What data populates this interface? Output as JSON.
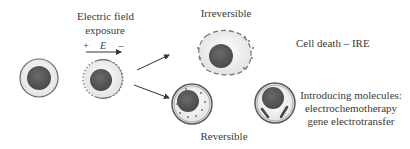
{
  "labels": {
    "exposure_line1": "Electric field",
    "exposure_line2": "exposure",
    "plus": "+",
    "field_symbol": "E",
    "minus": "–",
    "irreversible": "Irreversible",
    "cell_death": "Cell death – IRE",
    "reversible": "Reversible",
    "introducing_line1": "Introducing molecules:",
    "introducing_line2": "electrochemotherapy",
    "introducing_line3": "gene electrotransfer"
  },
  "colors": {
    "nucleus": "#575757",
    "cytoplasm": "#eeeeee",
    "membrane": "#6a6a6a",
    "text": "#3a3a3a",
    "arrow": "#333333"
  },
  "cells": [
    {
      "id": "intact",
      "description": "Intact cell"
    },
    {
      "id": "exposed",
      "description": "Cell during electric field exposure with pores at poles"
    },
    {
      "id": "irreversible",
      "description": "Irreversibly electroporated cell with disrupted membrane"
    },
    {
      "id": "reversible",
      "description": "Reversibly electroporated cell with small molecules entering"
    },
    {
      "id": "molecule-uptake",
      "description": "Cell with introduced molecules (rods)"
    }
  ]
}
